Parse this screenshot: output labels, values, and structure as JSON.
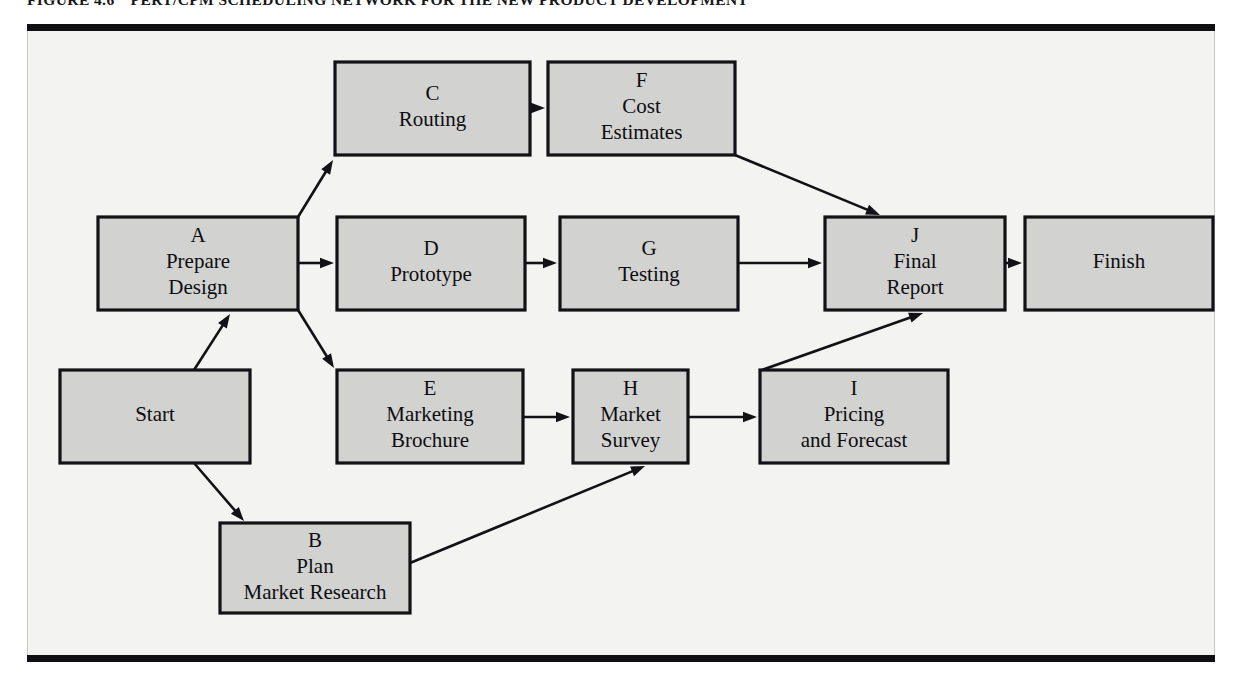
{
  "figure": {
    "number": "FIGURE 4.6",
    "title": "PERT/CPM SCHEDULING NETWORK FOR THE NEW PRODUCT DEVELOPMENT"
  },
  "colors": {
    "node_fill": "#d2d2d0",
    "node_stroke": "#121216",
    "panel_bg": "#f3f3f1",
    "rule": "#101014",
    "text": "#0d0d10"
  },
  "chart_data": {
    "type": "diagram",
    "subtype": "pert-cpm-network",
    "title": "PERT/CPM SCHEDULING NETWORK FOR THE NEW PRODUCT DEVELOPMENT",
    "nodes": [
      {
        "id": "start",
        "code": "",
        "lines": [
          "Start"
        ],
        "x": 60,
        "y": 370,
        "w": 190,
        "h": 93
      },
      {
        "id": "a",
        "code": "A",
        "lines": [
          "A",
          "Prepare",
          "Design"
        ],
        "x": 98,
        "y": 217,
        "w": 200,
        "h": 93
      },
      {
        "id": "b",
        "code": "B",
        "lines": [
          "B",
          "Plan",
          "Market Research"
        ],
        "x": 220,
        "y": 523,
        "w": 190,
        "h": 90
      },
      {
        "id": "c",
        "code": "C",
        "lines": [
          "C",
          "Routing"
        ],
        "x": 335,
        "y": 62,
        "w": 195,
        "h": 93
      },
      {
        "id": "d",
        "code": "D",
        "lines": [
          "D",
          "Prototype"
        ],
        "x": 337,
        "y": 217,
        "w": 188,
        "h": 93
      },
      {
        "id": "e",
        "code": "E",
        "lines": [
          "E",
          "Marketing",
          "Brochure"
        ],
        "x": 337,
        "y": 370,
        "w": 186,
        "h": 93
      },
      {
        "id": "f",
        "code": "F",
        "lines": [
          "F",
          "Cost",
          "Estimates"
        ],
        "x": 548,
        "y": 62,
        "w": 187,
        "h": 93
      },
      {
        "id": "g",
        "code": "G",
        "lines": [
          "G",
          "Testing"
        ],
        "x": 560,
        "y": 217,
        "w": 178,
        "h": 93
      },
      {
        "id": "h",
        "code": "H",
        "lines": [
          "H",
          "Market",
          "Survey"
        ],
        "x": 573,
        "y": 370,
        "w": 115,
        "h": 93
      },
      {
        "id": "i",
        "code": "I",
        "lines": [
          "I",
          "Pricing",
          "and Forecast"
        ],
        "x": 760,
        "y": 370,
        "w": 188,
        "h": 93
      },
      {
        "id": "j",
        "code": "J",
        "lines": [
          "J",
          "Final",
          "Report"
        ],
        "x": 825,
        "y": 217,
        "w": 180,
        "h": 93
      },
      {
        "id": "finish",
        "code": "",
        "lines": [
          "Finish"
        ],
        "x": 1025,
        "y": 217,
        "w": 188,
        "h": 93
      }
    ],
    "edges": [
      {
        "from": "start",
        "to": "a",
        "x1": 194,
        "y1": 370,
        "x2": 230,
        "y2": 314
      },
      {
        "from": "start",
        "to": "b",
        "x1": 194,
        "y1": 463,
        "x2": 244,
        "y2": 521
      },
      {
        "from": "a",
        "to": "c",
        "x1": 298,
        "y1": 217,
        "x2": 333,
        "y2": 160
      },
      {
        "from": "a",
        "to": "d",
        "x1": 298,
        "y1": 263,
        "x2": 334,
        "y2": 263
      },
      {
        "from": "a",
        "to": "e",
        "x1": 298,
        "y1": 310,
        "x2": 334,
        "y2": 368
      },
      {
        "from": "c",
        "to": "f",
        "x1": 530,
        "y1": 108,
        "x2": 545,
        "y2": 108
      },
      {
        "from": "d",
        "to": "g",
        "x1": 525,
        "y1": 263,
        "x2": 557,
        "y2": 263
      },
      {
        "from": "g",
        "to": "j",
        "x1": 738,
        "y1": 263,
        "x2": 822,
        "y2": 263
      },
      {
        "from": "f",
        "to": "j",
        "x1": 735,
        "y1": 155,
        "x2": 880,
        "y2": 215
      },
      {
        "from": "e",
        "to": "h",
        "x1": 523,
        "y1": 417,
        "x2": 570,
        "y2": 417
      },
      {
        "from": "h",
        "to": "i",
        "x1": 688,
        "y1": 417,
        "x2": 757,
        "y2": 417
      },
      {
        "from": "i",
        "to": "j",
        "x1": 762,
        "y1": 370,
        "x2": 923,
        "y2": 313
      },
      {
        "from": "b",
        "to": "h",
        "x1": 410,
        "y1": 563,
        "x2": 645,
        "y2": 466
      },
      {
        "from": "j",
        "to": "finish",
        "x1": 1005,
        "y1": 263,
        "x2": 1022,
        "y2": 263
      }
    ]
  }
}
